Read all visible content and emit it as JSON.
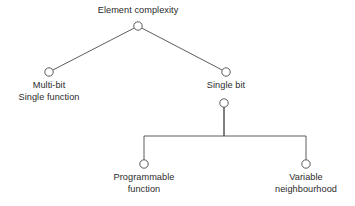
{
  "diagram": {
    "background_color": "#ffffff",
    "line_color": "#4a4a4a",
    "text_color": "#2b2b2b",
    "node_fill": "#ffffff",
    "nodes": [
      {
        "id": "root",
        "label_lines": [
          "Element complexity"
        ],
        "label_text": "Element complexity",
        "cx": 138,
        "cy": 26,
        "r": 4.2,
        "label_x": 138,
        "label_y": 5,
        "label_position": "above"
      },
      {
        "id": "multi-bit",
        "label_lines": [
          "Multi-bit",
          "Single function"
        ],
        "label_text": "Multi-bit Single function",
        "cx": 49,
        "cy": 72,
        "r": 4.2,
        "label_x": 49,
        "label_y": 80,
        "label_position": "below"
      },
      {
        "id": "single-bit",
        "label_lines": [
          "Single bit"
        ],
        "label_text": "Single bit",
        "cx": 226,
        "cy": 72,
        "r": 4.2,
        "label_x": 226,
        "label_y": 80,
        "label_position": "below"
      },
      {
        "id": "single-bit-split",
        "label_lines": [],
        "label_text": "",
        "cx": 224,
        "cy": 103,
        "r": 4.2,
        "label_x": 224,
        "label_y": 103,
        "label_position": "none"
      },
      {
        "id": "programmable-function",
        "label_lines": [
          "Programmable",
          "function"
        ],
        "label_text": "Programmable function",
        "cx": 144,
        "cy": 164,
        "r": 4.2,
        "label_x": 144,
        "label_y": 172,
        "label_position": "below"
      },
      {
        "id": "variable-neighbourhood",
        "label_lines": [
          "Variable",
          "neighbourhood"
        ],
        "label_text": "Variable neighbourhood",
        "cx": 306,
        "cy": 164,
        "r": 4.2,
        "label_x": 306,
        "label_y": 172,
        "label_position": "below"
      }
    ],
    "edges": [
      {
        "id": "root-to-multi-bit",
        "from": "root",
        "to": "multi-bit",
        "style": "diagonal",
        "path": "M 134.1 28.1 L 52.9 70.0"
      },
      {
        "id": "root-to-single-bit",
        "from": "root",
        "to": "single-bit",
        "style": "diagonal",
        "path": "M 141.9 28.1 L 222.1 70.0"
      },
      {
        "id": "split-to-programmable-function",
        "from": "single-bit-split",
        "to": "programmable-function",
        "style": "elbow",
        "path": "M 224 107.2 L 224 136 L 144 136 L 144 159.8"
      },
      {
        "id": "split-to-variable-neighbourhood",
        "from": "single-bit-split",
        "to": "variable-neighbourhood",
        "style": "elbow",
        "path": "M 224 107.2 L 224 136 L 306 136 L 306 159.8"
      }
    ]
  }
}
